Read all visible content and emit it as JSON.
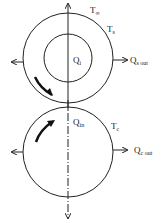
{
  "labels": {
    "t_inf": {
      "main": "T",
      "sub": "∞"
    },
    "t_s": {
      "main": "T",
      "sub": "s"
    },
    "q_i": {
      "main": "Q",
      "sub": "i"
    },
    "q_s_out": {
      "main": "Q",
      "sub": "s out"
    },
    "q_in": {
      "main": "Q",
      "sub": "in"
    },
    "t_c": {
      "main": "T",
      "sub": "c"
    },
    "q_c_out": {
      "main": "Q",
      "sub": "c out"
    }
  },
  "colors": {
    "stroke": "#222222",
    "background": "#ffffff"
  }
}
